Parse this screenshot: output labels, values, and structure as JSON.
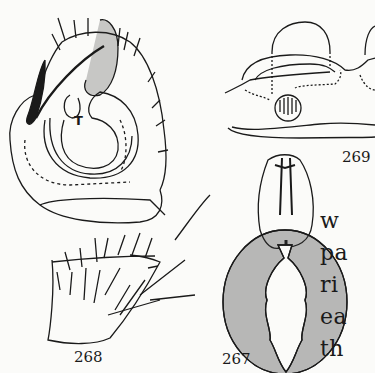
{
  "figures": [
    {
      "id": "268",
      "label": "268",
      "description": "male palp, lateral view",
      "inner_label": "T"
    },
    {
      "id": "269",
      "label": "269",
      "description": "epigynum"
    },
    {
      "id": "267",
      "label": "267",
      "description": "female spider, dorsal view"
    }
  ],
  "body_text": {
    "lines": [
      "w",
      "pa",
      "ri",
      "ea",
      "th"
    ]
  },
  "colors": {
    "background": "#fbfbf9",
    "ink": "#1a1a1a"
  }
}
